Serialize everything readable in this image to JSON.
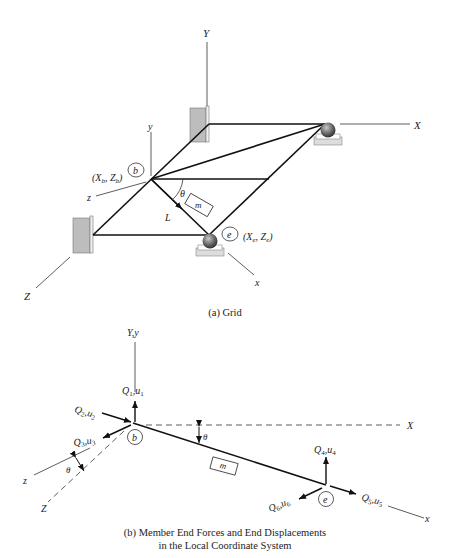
{
  "figure_a": {
    "caption": "(a) Grid",
    "global_axes": {
      "X": "X",
      "Y": "Y",
      "Z": "Z"
    },
    "local_axes": {
      "x": "x",
      "y": "y",
      "z": "z"
    },
    "node_begin": {
      "label": "b",
      "coords": "(X",
      "coords_sub1": "b",
      "coords_mid": ", Z",
      "coords_sub2": "b",
      "coords_end": ")"
    },
    "node_end": {
      "label": "e",
      "coords": "(X",
      "coords_sub1": "e",
      "coords_mid": ", Z",
      "coords_sub2": "e",
      "coords_end": ")"
    },
    "member_label": "m",
    "length_label": "L",
    "angle_label": "θ"
  },
  "figure_b": {
    "caption_line1": "(b) Member End Forces and End Displacements",
    "caption_line2": "in the Local Coordinate System",
    "vertical_axis_label": "Y,y",
    "global_X": "X",
    "global_Z": "Z",
    "local_x": "x",
    "local_z": "z",
    "node_begin": "b",
    "node_end": "e",
    "member_label": "m",
    "angle_label_1": "θ",
    "angle_label_2": "θ",
    "forces": [
      {
        "Q": "Q",
        "Qsub": "1",
        "u": "u",
        "usub": "1"
      },
      {
        "Q": "Q",
        "Qsub": "2",
        "u": "u",
        "usub": "2"
      },
      {
        "Q": "Q",
        "Qsub": "3",
        "u": "u",
        "usub": "3"
      },
      {
        "Q": "Q",
        "Qsub": "4",
        "u": "u",
        "usub": "4"
      },
      {
        "Q": "Q",
        "Qsub": "5",
        "u": "u",
        "usub": "5"
      },
      {
        "Q": "Q",
        "Qsub": "6",
        "u": "u",
        "usub": "6"
      }
    ]
  }
}
